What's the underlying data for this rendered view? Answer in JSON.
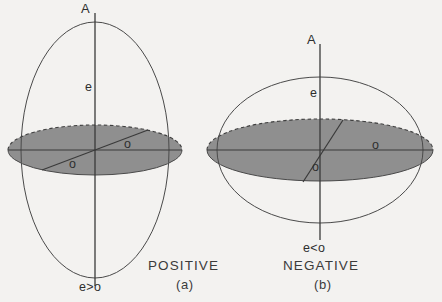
{
  "figure": {
    "background_color": "#f3f2f0",
    "line_color": "#4a4a4a",
    "shade_color": "#8f8f8f",
    "text_color": "#333333"
  },
  "panels": [
    {
      "id": "a",
      "caption": "POSITIVE",
      "sub_caption": "(a)",
      "axis_top_label": "A",
      "polar_axis_label": "e",
      "equatorial_labels": [
        "o",
        "o"
      ],
      "condition_label": "e>o",
      "shape": "prolate",
      "description": "Prolate ellipsoid with vertical symmetry axis A, polar semi-axis e greater than equatorial semi-axis o"
    },
    {
      "id": "b",
      "caption": "NEGATIVE",
      "sub_caption": "(b)",
      "axis_top_label": "A",
      "polar_axis_label": "e",
      "equatorial_labels": [
        "o",
        "o"
      ],
      "condition_label": "e<o",
      "shape": "oblate",
      "description": "Oblate ellipsoid with vertical symmetry axis A, polar semi-axis e less than equatorial semi-axis o"
    }
  ]
}
